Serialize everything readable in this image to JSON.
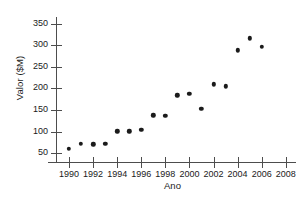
{
  "chart_data": {
    "type": "scatter",
    "title": "",
    "xlabel": "Ano",
    "ylabel": "Valor ($M)",
    "xlim": [
      1989,
      2008.6
    ],
    "ylim": [
      30,
      363
    ],
    "grid": false,
    "legend": false,
    "marker": {
      "shape": "circle",
      "color": "#1b1b1b",
      "size": 4.4
    },
    "axis_color": "#4d4d4d",
    "background": "#ffffff",
    "xticks": [
      1990,
      1992,
      1994,
      1996,
      1998,
      2000,
      2002,
      2004,
      2006,
      2008
    ],
    "xtick_labels": [
      "1990",
      "1992",
      "1994",
      "1996",
      "1998",
      "2000",
      "2002",
      "2004",
      "2006",
      "2008"
    ],
    "yticks": [
      50,
      100,
      150,
      200,
      250,
      300,
      350
    ],
    "ytick_labels": [
      "50",
      "100",
      "150",
      "200",
      "250",
      "300",
      "350"
    ],
    "x": [
      1990,
      1991,
      1992,
      1993,
      1994,
      1995,
      1996,
      1997,
      1998,
      1999,
      2000,
      2001,
      2002,
      2003,
      2004,
      2005,
      2006
    ],
    "values": [
      61,
      72,
      71,
      72,
      101,
      101,
      105,
      138,
      137,
      184,
      187,
      153,
      210,
      205,
      288,
      316,
      296
    ],
    "points": [
      {
        "x": 1990,
        "y": 61
      },
      {
        "x": 1991,
        "y": 72
      },
      {
        "x": 1992,
        "y": 71
      },
      {
        "x": 1993,
        "y": 72
      },
      {
        "x": 1994,
        "y": 101
      },
      {
        "x": 1995,
        "y": 101
      },
      {
        "x": 1996,
        "y": 105
      },
      {
        "x": 1997,
        "y": 138
      },
      {
        "x": 1998,
        "y": 137
      },
      {
        "x": 1999,
        "y": 184
      },
      {
        "x": 2000,
        "y": 187
      },
      {
        "x": 2001,
        "y": 153
      },
      {
        "x": 2002,
        "y": 210
      },
      {
        "x": 2003,
        "y": 205
      },
      {
        "x": 2004,
        "y": 288
      },
      {
        "x": 2005,
        "y": 316
      },
      {
        "x": 2006,
        "y": 296
      }
    ]
  }
}
